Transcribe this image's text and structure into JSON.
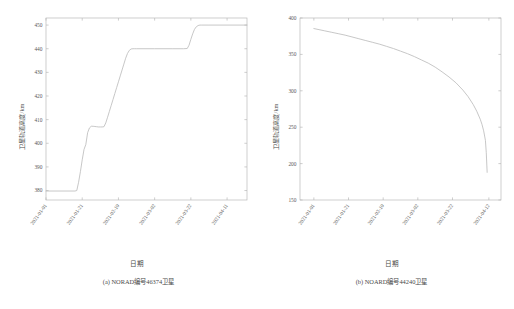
{
  "figure": {
    "xlabel": "日期",
    "ylabel": "卫星轨道高度/km",
    "line_color": "#bdbdbd",
    "axis_color": "#b9b9b9"
  },
  "panels": [
    {
      "id": "panel-a",
      "caption": "(a) NORAD编号46374卫星",
      "xlabel": "日期",
      "ylabel": "卫星轨道高度/km"
    },
    {
      "id": "panel-b",
      "caption": "(b) NOARD编号44240卫星",
      "xlabel": "日期",
      "ylabel": "卫星轨道高度/km"
    }
  ],
  "chart_data": [
    {
      "type": "line",
      "title": "(a) NORAD编号46374卫星",
      "xlabel": "日期",
      "ylabel": "卫星轨道高度/km",
      "grid": false,
      "legend": "none",
      "xticklabels": [
        "2021-01-01",
        "2021-01-21",
        "2021-02-10",
        "2021-03-02",
        "2021-03-22",
        "2021-04-11"
      ],
      "yticklabels": [
        "380",
        "390",
        "400",
        "410",
        "420",
        "430",
        "440",
        "450"
      ],
      "ylim": [
        376,
        453
      ],
      "xlim": [
        0,
        111
      ],
      "xtick_days": [
        0,
        20,
        40,
        60,
        80,
        100
      ],
      "ytick_values": [
        380,
        390,
        400,
        410,
        420,
        430,
        440,
        450
      ],
      "series": [
        {
          "name": "轨道高度",
          "x_days": [
            0,
            16,
            17,
            18,
            19,
            20,
            21,
            22,
            23,
            24,
            25,
            26,
            27,
            28,
            29,
            30,
            31,
            32,
            33,
            34,
            35,
            36,
            37,
            38,
            39,
            40,
            41,
            42,
            43,
            44,
            45,
            46,
            47,
            48,
            49,
            50,
            60,
            70,
            76,
            78,
            79,
            80,
            81,
            82,
            83,
            84,
            85,
            86,
            90,
            100,
            111
          ],
          "values": [
            379.8,
            379.8,
            380.0,
            383.5,
            388.0,
            393.0,
            397.4,
            399.5,
            404.5,
            406.5,
            407.2,
            407.2,
            407.1,
            407.0,
            406.9,
            406.9,
            406.9,
            407.0,
            408.6,
            411.0,
            413.5,
            416.0,
            418.5,
            421.0,
            423.5,
            426.0,
            428.5,
            431.0,
            433.5,
            436.0,
            438.0,
            439.3,
            439.9,
            440.0,
            440.0,
            440.0,
            440.0,
            440.0,
            440.0,
            440.1,
            441.5,
            444.0,
            446.3,
            448.2,
            449.3,
            449.8,
            450.0,
            450.0,
            450.0,
            450.0,
            450.0
          ]
        }
      ]
    },
    {
      "type": "line",
      "title": "(b) NOARD编号44240卫星",
      "xlabel": "日期",
      "ylabel": "卫星轨道高度/km",
      "grid": false,
      "legend": "none",
      "xticklabels": [
        "2021-01-01",
        "2021-01-21",
        "2021-02-10",
        "2021-03-02",
        "2021-03-22",
        "2021-04-12"
      ],
      "yticklabels": [
        "150",
        "200",
        "250",
        "300",
        "350",
        "400"
      ],
      "ylim": [
        150,
        400
      ],
      "xlim": [
        -8,
        108
      ],
      "xtick_days": [
        0,
        20,
        40,
        60,
        80,
        101
      ],
      "ytick_values": [
        150,
        200,
        250,
        300,
        350,
        400
      ],
      "series": [
        {
          "name": "轨道高度",
          "x_days": [
            0,
            3,
            6,
            10,
            14,
            18,
            22,
            26,
            30,
            34,
            38,
            42,
            46,
            50,
            54,
            58,
            62,
            66,
            70,
            74,
            78,
            82,
            86,
            89,
            92,
            94,
            96,
            97,
            98,
            99,
            99.5,
            100
          ],
          "values": [
            385.5,
            384.0,
            382.5,
            380.5,
            378.5,
            376.5,
            374.0,
            371.5,
            369.0,
            366.5,
            364.0,
            361.0,
            358.0,
            354.5,
            351.0,
            347.0,
            342.5,
            338.0,
            332.5,
            326.0,
            319.0,
            311.0,
            301.0,
            292.0,
            281.0,
            272.0,
            261.0,
            254.0,
            245.0,
            232.0,
            215.0,
            188.0
          ]
        }
      ]
    }
  ]
}
